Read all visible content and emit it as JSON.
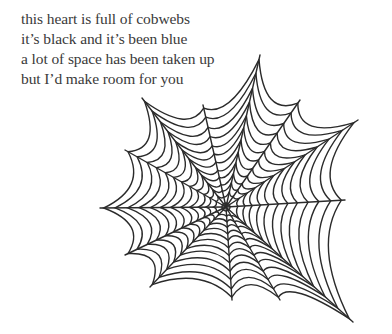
{
  "poem": {
    "lines": [
      "this heart is full of cobwebs",
      "it’s black and it’s been blue",
      "a lot of space has been taken up",
      "but I’d make room for you"
    ]
  },
  "illustration": {
    "icon": "spiderweb-icon",
    "stroke_color": "#2b2b2b",
    "background": "#ffffff"
  }
}
